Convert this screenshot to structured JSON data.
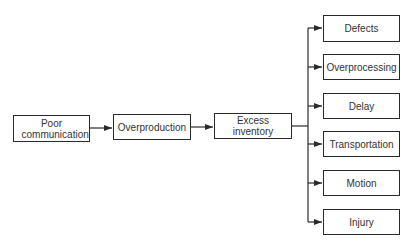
{
  "diagram": {
    "chain": [
      {
        "id": "poor-communication",
        "label": "Poor communication"
      },
      {
        "id": "overproduction",
        "label": "Overproduction"
      },
      {
        "id": "excess-inventory",
        "label": "Excess inventory"
      }
    ],
    "outcomes": [
      {
        "id": "defects",
        "label": "Defects"
      },
      {
        "id": "overprocessing",
        "label": "Overprocessing"
      },
      {
        "id": "delay",
        "label": "Delay"
      },
      {
        "id": "transportation",
        "label": "Transportation"
      },
      {
        "id": "motion",
        "label": "Motion"
      },
      {
        "id": "injury",
        "label": "Injury"
      }
    ],
    "colors": {
      "stroke": "#2a2a2a",
      "text": "#333333",
      "background": "#ffffff"
    }
  }
}
